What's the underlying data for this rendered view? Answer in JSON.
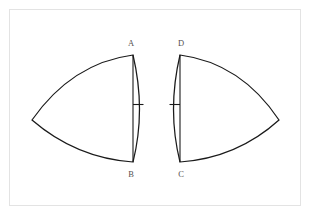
{
  "figure": {
    "background_color": "#ffffff",
    "frame": {
      "name": "figure-border",
      "color": "#e3e3e3",
      "x": 9,
      "y": 9,
      "width": 292,
      "height": 197
    },
    "stroke_color": "#1a1a1a",
    "label_color": "#55504e",
    "labels": [
      {
        "id": "A",
        "text": "A",
        "x": 131,
        "y": 46
      },
      {
        "id": "B",
        "text": "B",
        "x": 131,
        "y": 177
      },
      {
        "id": "C",
        "text": "C",
        "x": 181,
        "y": 177
      },
      {
        "id": "D",
        "text": "D",
        "x": 181,
        "y": 46
      }
    ],
    "shapes": [
      {
        "name": "left-curved-triangle",
        "vertices": {
          "top": {
            "label": "A",
            "x": 133,
            "y": 55
          },
          "bottom": {
            "label": "B",
            "x": 133,
            "y": 162
          },
          "apex": {
            "x": 32,
            "y": 120
          }
        },
        "outline_path": "M 133 55 Q 72 63 32 120 Q 76 158 133 162 Q 146 110 133 55 Z",
        "chord_path": "M 133 55 L 133 162",
        "tick": {
          "x1": 133,
          "y1": 104.5,
          "x2": 143.5,
          "y2": 104.5
        }
      },
      {
        "name": "right-curved-triangle",
        "vertices": {
          "top": {
            "label": "D",
            "x": 180,
            "y": 55
          },
          "bottom": {
            "label": "C",
            "x": 180,
            "y": 162
          },
          "apex": {
            "x": 279,
            "y": 120
          }
        },
        "outline_path": "M 180 55 Q 241 63 279 120 Q 237 158 180 162 Q 167 110 180 55 Z",
        "chord_path": "M 180 55 L 180 162",
        "tick": {
          "x1": 180,
          "y1": 104.5,
          "x2": 169.5,
          "y2": 104.5
        }
      }
    ]
  }
}
